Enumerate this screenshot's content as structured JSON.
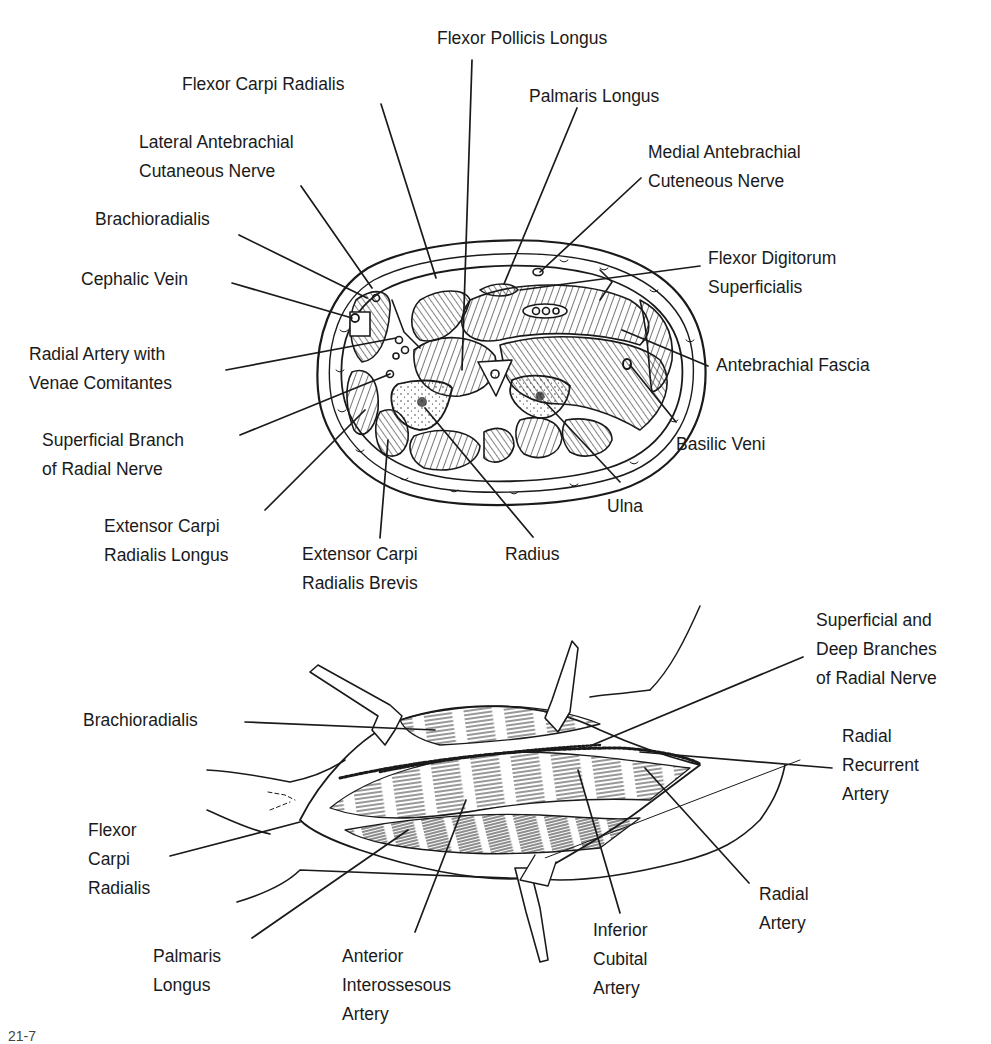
{
  "figure": {
    "number_partial": "21-7",
    "upper_panel": {
      "title": "Cross-section of the forearm",
      "labels": {
        "flexor_pollicis_longus": [
          "Flexor Pollicis Longus"
        ],
        "flexor_carpi_radialis": [
          "Flexor Carpi Radialis"
        ],
        "palmaris_longus": [
          "Palmaris Longus"
        ],
        "lateral_antebrachial_cutaneous_nerve": [
          "Lateral Antebrachial",
          "Cutaneous Nerve"
        ],
        "medial_antebrachial_cuteneous_nerve": [
          "Medial Antebrachial",
          "Cuteneous Nerve"
        ],
        "brachioradialis": [
          "Brachioradialis"
        ],
        "flexor_digitorum_superficialis": [
          "Flexor Digitorum",
          "Superficialis"
        ],
        "cephalic_vein": [
          "Cephalic Vein"
        ],
        "radial_artery_venae": [
          "Radial Artery with",
          "Venae Comitantes"
        ],
        "antebrachial_fascia": [
          "Antebrachial Fascia"
        ],
        "superficial_branch_radial_nerve": [
          "Superficial Branch",
          "of Radial Nerve"
        ],
        "basilic_veni": [
          "Basilic Veni"
        ],
        "ulna": [
          "Ulna"
        ],
        "extensor_carpi_radialis_longus": [
          "Extensor Carpi",
          "Radialis Longus"
        ],
        "radius": [
          "Radius"
        ],
        "extensor_carpi_radialis_brevis": [
          "Extensor Carpi",
          "Radialis Brevis"
        ]
      }
    },
    "lower_panel": {
      "title": "Anterior approach to the proximal radius",
      "labels": {
        "superficial_deep_branches": [
          "Superficial and",
          "Deep Branches",
          "of Radial Nerve"
        ],
        "brachioradialis": [
          "Brachioradialis"
        ],
        "radial_recurrent_artery": [
          "Radial",
          "Recurrent",
          "Artery"
        ],
        "flexor_carpi_radialis": [
          "Flexor",
          "Carpi",
          "Radialis"
        ],
        "radial_artery": [
          "Radial",
          "Artery"
        ],
        "palmaris_longus": [
          "Palmaris",
          "Longus"
        ],
        "anterior_interossesous_artery": [
          "Anterior",
          "Interossesous",
          "Artery"
        ],
        "inferior_cubital_artery": [
          "Inferior",
          "Cubital",
          "Artery"
        ]
      }
    },
    "colors": {
      "ink": "#1a1a1a",
      "background": "#ffffff"
    }
  }
}
